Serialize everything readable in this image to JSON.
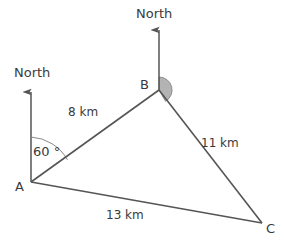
{
  "figure": {
    "type": "geometry-diagram",
    "background_color": "#ffffff",
    "stroke_color": "#555555",
    "text_color": "#3a3a3a",
    "shade_color": "#b3b3b3"
  },
  "vertices": [
    {
      "id": "A",
      "label": "A",
      "x": 31,
      "y": 182,
      "label_x": 15,
      "label_y": 191
    },
    {
      "id": "B",
      "label": "B",
      "x": 159,
      "y": 90,
      "label_x": 140,
      "label_y": 89
    },
    {
      "id": "C",
      "label": "C",
      "x": 262,
      "y": 223,
      "label_x": 266,
      "label_y": 233
    }
  ],
  "sides": [
    {
      "id": "AB",
      "label": "8 km",
      "label_x": 68,
      "label_y": 116
    },
    {
      "id": "BC",
      "label": "11 km",
      "label_x": 201,
      "label_y": 147
    },
    {
      "id": "AC",
      "label": "13 km",
      "label_x": 106,
      "label_y": 219
    }
  ],
  "north_arrows": [
    {
      "id": "north-at-A",
      "label": "North",
      "label_x": 14,
      "label_y": 77,
      "line_x": 31,
      "tip_y": 88,
      "base_y": 182
    },
    {
      "id": "north-at-B",
      "label": "North",
      "label_x": 136,
      "label_y": 18,
      "line_x": 159,
      "tip_y": 26,
      "base_y": 90
    }
  ],
  "angles": [
    {
      "id": "angle-at-A",
      "label": "60 °",
      "value": 60,
      "unit": "degrees",
      "vertex": "A",
      "label_x": 33,
      "label_y": 156,
      "arc_radius": 45,
      "shaded": false
    },
    {
      "id": "angle-at-B",
      "label": "",
      "vertex": "B",
      "radius": 13,
      "shaded": true,
      "shade_color": "#b3b3b3"
    }
  ]
}
